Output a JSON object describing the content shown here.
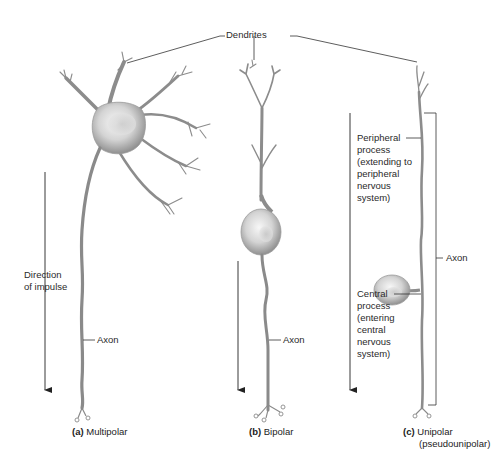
{
  "figure": {
    "top_label": "Dendrites",
    "colors": {
      "background": "#ffffff",
      "neuron_fill": "#d6d6d6",
      "neuron_stroke": "#8a8a8a",
      "leader_line": "#333333",
      "text": "#2a2a2a"
    },
    "panels": [
      {
        "id": "a",
        "letter": "(a)",
        "name": "Multipolar",
        "labels": {
          "direction": "Direction\nof impulse",
          "axon": "Axon"
        }
      },
      {
        "id": "b",
        "letter": "(b)",
        "name": "Bipolar",
        "labels": {
          "axon": "Axon"
        }
      },
      {
        "id": "c",
        "letter": "(c)",
        "name": "Unipolar",
        "subname": "(pseudounipolar)",
        "labels": {
          "peripheral": "Peripheral\nprocess\n(extending to\nperipheral\nnervous\nsystem)",
          "central": "Central\nprocess\n(entering\ncentral\nnervous\nsystem)",
          "axon": "Axon"
        }
      }
    ]
  }
}
